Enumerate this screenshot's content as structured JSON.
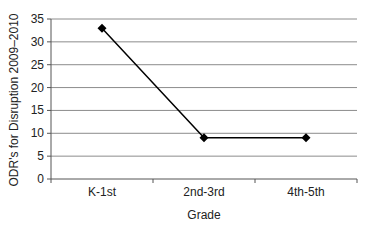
{
  "chart_data": {
    "type": "line",
    "title": "",
    "xlabel": "Grade",
    "ylabel": "ODR's for Disruption 2009–2010",
    "categories": [
      "K-1st",
      "2nd-3rd",
      "4th-5th"
    ],
    "series": [
      {
        "name": "ODR's for Disruption",
        "values": [
          33,
          9,
          9
        ],
        "marker": "diamond",
        "color": "#000000"
      }
    ],
    "ylim": [
      0,
      35
    ],
    "yticks": [
      0,
      5,
      10,
      15,
      20,
      25,
      30,
      35
    ],
    "grid": true,
    "legend": "none"
  },
  "colors": {
    "gridline": "#8c8c8c",
    "axis": "#555555",
    "line": "#000000"
  }
}
